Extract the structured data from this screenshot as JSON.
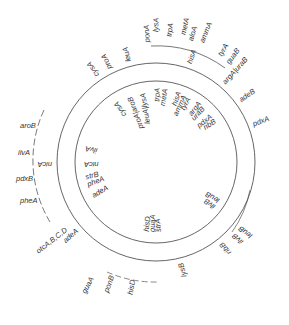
{
  "map": {
    "center": [
      156,
      162
    ],
    "inner_radius": 81,
    "outer_radius": 99,
    "line_color": "#555555",
    "text_color": "#333333",
    "inner_labels": [
      {
        "text": "cysA",
        "angle": -32,
        "r": 72
      },
      {
        "text": "proA|aroB",
        "angle": -20,
        "r": 70
      },
      {
        "text": "leuA|lysA",
        "angle": -9,
        "r": 70
      },
      {
        "text": "trpA",
        "angle": 3,
        "r": 74
      },
      {
        "text": "metA",
        "angle": 9,
        "r": 74
      },
      {
        "text": "hisA",
        "angle": 20,
        "r": 74
      },
      {
        "text": "ammA",
        "angle": 25,
        "r": 72
      },
      {
        "text": "tyrA",
        "angle": 29,
        "r": 72
      },
      {
        "text": "argA",
        "angle": 38,
        "r": 74
      },
      {
        "text": "uraB",
        "angle": 43,
        "r": 72
      },
      {
        "text": "pdxA",
        "angle": 52,
        "r": 72
      },
      {
        "text": "ribB",
        "angle": 57,
        "r": 72
      },
      {
        "text": "leuB",
        "angle": 120,
        "r": 74
      },
      {
        "text": "ilvB",
        "angle": 126,
        "r": 74
      },
      {
        "text": "strA",
        "angle": 176,
        "r": 70
      },
      {
        "text": "guaA",
        "angle": 181,
        "r": 70
      },
      {
        "text": "hisD",
        "angle": 186,
        "r": 70
      },
      {
        "text": "adeA",
        "angle": 240,
        "r": 72
      },
      {
        "text": "pheA",
        "angle": 250,
        "r": 72
      },
      {
        "text": "strB",
        "angle": 256,
        "r": 72
      },
      {
        "text": "nicA",
        "angle": 270,
        "r": 72
      },
      {
        "text": "ilvA",
        "angle": 283,
        "r": 72
      }
    ],
    "outer_labels": [
      {
        "text": "cysA",
        "angle": -33,
        "r": 104
      },
      {
        "text": "proA",
        "angle": -25,
        "r": 104
      },
      {
        "text": "leuA",
        "angle": -14,
        "r": 104
      },
      {
        "text": "hisA",
        "angle": 20,
        "r": 104
      },
      {
        "text": "argA|uraB",
        "angle": 42,
        "r": 104
      },
      {
        "text": "adeB",
        "angle": 55,
        "r": 104
      },
      {
        "text": "pdxA",
        "angle": 70,
        "r": 104
      },
      {
        "text": "leuB",
        "angle": 127,
        "r": 106
      },
      {
        "text": "ilvB",
        "angle": 132,
        "r": 106
      },
      {
        "text": "ribB",
        "angle": 140,
        "r": 104
      },
      {
        "text": "lysB",
        "angle": 165,
        "r": 104
      },
      {
        "text": "hisD",
        "angle": 190,
        "r": 120
      },
      {
        "text": "ponB",
        "angle": 200,
        "r": 122
      },
      {
        "text": "guaA",
        "angle": 208,
        "r": 132
      },
      {
        "text": "nicA",
        "angle": 270,
        "r": 104
      },
      {
        "text": "otcA,B,C,D",
        "angle": 232,
        "r": 112
      },
      {
        "text": "adeA",
        "angle": 228,
        "r": 104
      }
    ],
    "top_arc_labels": [
      {
        "text": "ponA",
        "angle": -3,
        "r": 120
      },
      {
        "text": "lysA",
        "angle": 1,
        "r": 130
      },
      {
        "text": "trpA",
        "angle": 7,
        "r": 126
      },
      {
        "text": "metA",
        "angle": 13,
        "r": 130
      },
      {
        "text": "aloA",
        "angle": 17,
        "r": 126
      },
      {
        "text": "ammA",
        "angle": 22,
        "r": 128
      },
      {
        "text": "tyrA",
        "angle": 32,
        "r": 124
      },
      {
        "text": "guaB",
        "angle": 37,
        "r": 122
      }
    ],
    "left_arc_labels": [
      {
        "text": "aroB",
        "x": 20,
        "y": 128
      },
      {
        "text": "ilvA",
        "x": 18,
        "y": 155
      },
      {
        "text": "pdxB",
        "x": 16,
        "y": 181
      },
      {
        "text": "pheA",
        "x": 20,
        "y": 203
      }
    ]
  }
}
